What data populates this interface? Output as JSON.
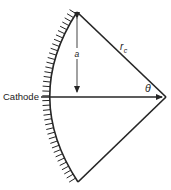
{
  "figure": {
    "name": "cathode-geometry-diagram",
    "background_color": "#ffffff",
    "line_color": "#262626",
    "width": 171,
    "height": 190
  },
  "labels": {
    "cathode": "Cathode",
    "radius_a": "a",
    "radius_rc_symbol": "r",
    "radius_rc_subscript": "c",
    "angle_theta": "θ"
  },
  "chart_data": {
    "type": "diagram",
    "title": "",
    "annotations": [
      {
        "label": "Cathode",
        "target": "hatched-arc",
        "position": "left"
      },
      {
        "label": "a",
        "target": "vertical-dimension",
        "position": "center-upper"
      },
      {
        "label": "r_c",
        "target": "upper-hypotenuse",
        "position": "upper-right"
      },
      {
        "label": "θ",
        "target": "right-vertex-angle",
        "position": "right"
      }
    ],
    "points": {
      "apex_top": [
        77,
        12
      ],
      "apex_bottom": [
        78,
        182
      ],
      "vertex_right": [
        166,
        97
      ],
      "arc_left_extreme": [
        41,
        97
      ],
      "axis_origin": [
        41,
        97
      ]
    },
    "segments": [
      {
        "name": "upper-hypotenuse",
        "from": [
          77,
          12
        ],
        "to": [
          166,
          97
        ],
        "label": "r_c"
      },
      {
        "name": "lower-hypotenuse",
        "from": [
          78,
          182
        ],
        "to": [
          166,
          97
        ],
        "label": ""
      },
      {
        "name": "horizontal-axis",
        "from": [
          41,
          97
        ],
        "to": [
          166,
          97
        ],
        "label": "",
        "arrow": "end"
      },
      {
        "name": "vertical-dimension",
        "from": [
          77,
          14
        ],
        "to": [
          77,
          97
        ],
        "label": "a",
        "arrow": "both"
      }
    ],
    "arcs": [
      {
        "name": "cathode-arc",
        "from": [
          77,
          12
        ],
        "through": [
          41,
          97
        ],
        "to": [
          78,
          182
        ],
        "hatched": true,
        "hatch_side": "outer"
      }
    ]
  }
}
